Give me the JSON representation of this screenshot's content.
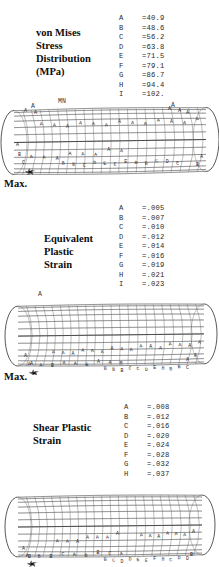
{
  "figure": {
    "kind": "fea-contour-plots",
    "sections": [
      {
        "id": "von-mises",
        "title_lines": [
          "von Mises",
          "Stress",
          "Distribution",
          "(MPa)"
        ],
        "legend": [
          {
            "key": "A",
            "value": "=40.9"
          },
          {
            "key": "B",
            "value": "=48.6"
          },
          {
            "key": "C",
            "value": "=56.2"
          },
          {
            "key": "D",
            "value": "=63.8"
          },
          {
            "key": "E",
            "value": "=71.5"
          },
          {
            "key": "F",
            "value": "=79.1"
          },
          {
            "key": "G",
            "value": "=86.7"
          },
          {
            "key": "H",
            "value": "=94.4"
          },
          {
            "key": "I",
            "value": "=102."
          }
        ],
        "annotations": {
          "top_center": "MN",
          "top_left": "A",
          "top_right": "A",
          "max": "Max."
        }
      },
      {
        "id": "equivalent-plastic-strain",
        "title_lines": [
          "Equivalent",
          "Plastic",
          "Strain"
        ],
        "legend": [
          {
            "key": "A",
            "value": "=.005"
          },
          {
            "key": "B",
            "value": "=.007"
          },
          {
            "key": "C",
            "value": "=.010"
          },
          {
            "key": "D",
            "value": "=.012"
          },
          {
            "key": "E",
            "value": "=.014"
          },
          {
            "key": "F",
            "value": "=.016"
          },
          {
            "key": "G",
            "value": "=.019"
          },
          {
            "key": "H",
            "value": "=.021"
          },
          {
            "key": "I",
            "value": "=.023"
          }
        ],
        "annotations": {
          "top_center": "",
          "top_left": "A",
          "top_right": "",
          "max": "Max."
        }
      },
      {
        "id": "shear-plastic-strain",
        "title_lines": [
          "Shear Plastic",
          "Strain"
        ],
        "legend": [
          {
            "key": "A",
            "value": "=.008"
          },
          {
            "key": "B",
            "value": "=.012"
          },
          {
            "key": "C",
            "value": "=.016"
          },
          {
            "key": "D",
            "value": "=.020"
          },
          {
            "key": "E",
            "value": "=.024"
          },
          {
            "key": "F",
            "value": "=.028"
          },
          {
            "key": "G",
            "value": "=.032"
          },
          {
            "key": "H",
            "value": "=.037"
          }
        ],
        "annotations": {
          "top_center": "",
          "top_left": "",
          "top_right": "",
          "max": ""
        }
      }
    ],
    "contour_letters_on_mesh": [
      "A",
      "B",
      "C",
      "D",
      "E",
      "F",
      "G",
      "H",
      "I"
    ],
    "colors": {
      "ink": "#1a1a1a",
      "mesh": "#5d5d5d",
      "outline": "#2f2f2f",
      "background": "#ffffff"
    }
  }
}
